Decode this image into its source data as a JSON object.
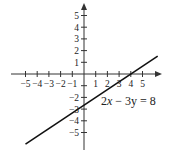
{
  "chart_data": {
    "type": "line",
    "title": "",
    "equation": "2x − 3y = 8",
    "equation_parts": {
      "pre": "2",
      "var_x": "x",
      "mid": " − 3y = 8"
    },
    "xlabel": "",
    "ylabel": "",
    "xlim": [
      -5.8,
      6.5
    ],
    "ylim": [
      -6.5,
      6
    ],
    "grid": false,
    "x_ticks": [
      -5,
      -4,
      -3,
      -2,
      -1,
      1,
      2,
      3,
      4,
      5
    ],
    "x_tick_labels": [
      "−5",
      "−4",
      "−3",
      "−2",
      "−1",
      "1",
      "2",
      "3",
      "4",
      "5"
    ],
    "y_ticks": [
      -5,
      -4,
      -3,
      -2,
      -1,
      1,
      2,
      3,
      4,
      5
    ],
    "y_tick_labels_pos": [
      "1",
      "2",
      "3",
      "4",
      "5"
    ],
    "y_tick_labels_neg": [
      "−2",
      "−3",
      "−4",
      "−5"
    ],
    "series": [
      {
        "name": "2x − 3y = 8",
        "x": [
          -5,
          0,
          4,
          6.3
        ],
        "y": [
          -6,
          -2.667,
          0,
          1.533
        ]
      }
    ],
    "line_color": "#111111"
  }
}
